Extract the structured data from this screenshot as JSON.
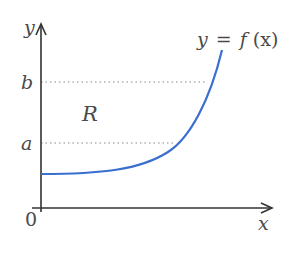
{
  "diagram": {
    "axes": {
      "x_label": "x",
      "y_label": "y",
      "origin_label": "0"
    },
    "levels": [
      {
        "label": "b",
        "y_px": 82
      },
      {
        "label": "a",
        "y_px": 143
      }
    ],
    "region_label": "R",
    "curve_label": "y = f(x)",
    "curve_label_parts": {
      "lhs": "y",
      "eq": "=",
      "f": "f",
      "arg": "(x)"
    },
    "colors": {
      "curve": "#3a6fd0",
      "axes": "#333333",
      "text": "#4a4a4a",
      "dotted": "#888888"
    }
  }
}
